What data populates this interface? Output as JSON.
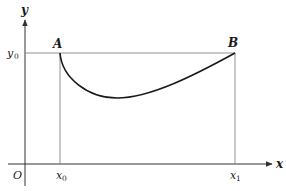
{
  "diagram": {
    "type": "function-curve-on-axes",
    "axes": {
      "x_label": "x",
      "y_label": "y",
      "origin_label": "O"
    },
    "ticks": {
      "x0_base": "x",
      "x0_sub": "0",
      "x1_base": "x",
      "x1_sub": "1",
      "y0_base": "y",
      "y0_sub": "0"
    },
    "points": {
      "A": "A",
      "B": "B"
    },
    "colors": {
      "axis": "#333333",
      "guide": "#777777",
      "curve": "#1a1a1a",
      "background": "#ffffff"
    }
  }
}
